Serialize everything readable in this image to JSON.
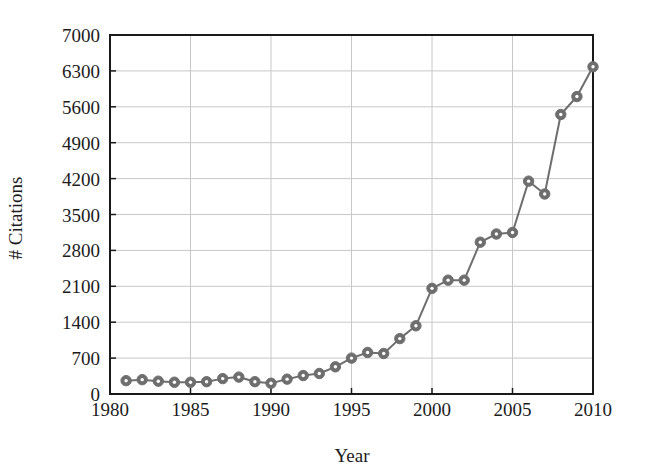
{
  "chart_data": {
    "type": "line",
    "title": "",
    "subtitle": "",
    "xlabel": "Year",
    "ylabel": "# Citations",
    "xlim": [
      1980,
      2010
    ],
    "ylim": [
      0,
      7000
    ],
    "xticks": [
      1980,
      1985,
      1990,
      1995,
      2000,
      2005,
      2010
    ],
    "xtick_labels": [
      "1980",
      "1985",
      "1990",
      "1995",
      "2000",
      "2005",
      "2010"
    ],
    "yticks": [
      0,
      700,
      1400,
      2100,
      2800,
      3500,
      4200,
      4900,
      5600,
      6300,
      7000
    ],
    "ytick_labels": [
      "0",
      "700",
      "1400",
      "2100",
      "2800",
      "3500",
      "4200",
      "4900",
      "5600",
      "6300",
      "7000"
    ],
    "grid": true,
    "legend": null,
    "legend_position": "none",
    "marker": "circle",
    "line_color": "#6e6e6e",
    "marker_face_color": "#ffffff",
    "marker_edge_color": "#6e6e6e",
    "grid_color": "#c8c8c8",
    "axes_color": "#1a1a1a",
    "background_color": "#ffffff",
    "x": [
      1981,
      1982,
      1983,
      1984,
      1985,
      1986,
      1987,
      1988,
      1989,
      1990,
      1991,
      1992,
      1993,
      1994,
      1995,
      1996,
      1997,
      1998,
      1999,
      2000,
      2001,
      2002,
      2003,
      2004,
      2005,
      2006,
      2007,
      2008,
      2009,
      2010
    ],
    "values": [
      260,
      280,
      250,
      230,
      230,
      240,
      300,
      330,
      240,
      210,
      290,
      360,
      400,
      530,
      700,
      810,
      790,
      1080,
      1330,
      2060,
      2220,
      2220,
      2960,
      3120,
      3150,
      4150,
      3900,
      5450,
      5800,
      6380
    ],
    "series": [
      {
        "name": "# Citations",
        "values": [
          260,
          280,
          250,
          230,
          230,
          240,
          300,
          330,
          240,
          210,
          290,
          360,
          400,
          530,
          700,
          810,
          790,
          1080,
          1330,
          2060,
          2220,
          2220,
          2960,
          3120,
          3150,
          4150,
          3900,
          5450,
          5800,
          6380
        ]
      }
    ]
  }
}
